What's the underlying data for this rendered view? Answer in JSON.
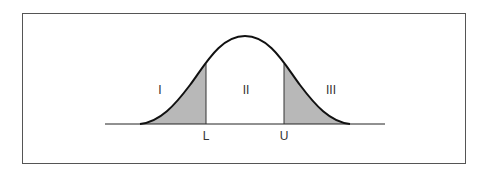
{
  "diagram": {
    "type": "normal-distribution",
    "regions": [
      {
        "id": "I",
        "label": "I",
        "shaded": true
      },
      {
        "id": "II",
        "label": "II",
        "shaded": false
      },
      {
        "id": "III",
        "label": "III",
        "shaded": true
      }
    ],
    "axis_labels": {
      "lower": "L",
      "upper": "U"
    },
    "colors": {
      "shade": "#b8b8b8",
      "curve": "#111111",
      "frame": "#555555"
    }
  }
}
